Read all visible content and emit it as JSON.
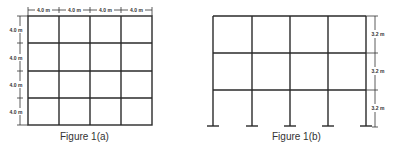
{
  "figure_a": {
    "caption": "Figure 1(a)",
    "type": "plan-grid",
    "bays_x": 4,
    "bays_y": 4,
    "top_dimensions": [
      "4.0 m",
      "4.0 m",
      "4.0 m",
      "4.0 m"
    ],
    "left_dimensions": [
      "4.0 m",
      "4.0 m",
      "4.0 m",
      "4.0 m"
    ]
  },
  "figure_b": {
    "caption": "Figure 1(b)",
    "type": "elevation-frame",
    "bays": 4,
    "storeys": 3,
    "right_dimensions": [
      "3.2 m",
      "3.2 m",
      "3.2 m"
    ]
  },
  "colors": {
    "line": "#2a2a2a",
    "text": "#333333",
    "background": "#ffffff"
  }
}
